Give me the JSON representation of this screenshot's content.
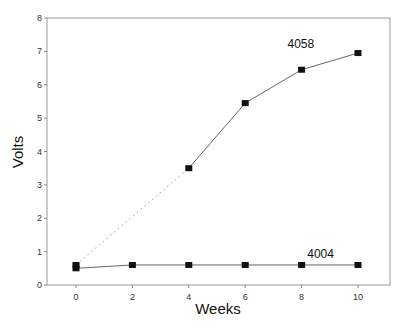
{
  "chart_data": {
    "type": "line",
    "title": "",
    "xlabel": "Weeks",
    "ylabel": "Volts",
    "xlim": [
      -1.05,
      11.1
    ],
    "ylim": [
      0,
      8
    ],
    "x_ticks": [
      0,
      2,
      4,
      6,
      8,
      10
    ],
    "y_ticks": [
      0,
      1,
      2,
      3,
      4,
      5,
      6,
      7,
      8
    ],
    "grid": false,
    "legend": "inline labels",
    "series": [
      {
        "name": "4058",
        "x": [
          0,
          4,
          6,
          8,
          10
        ],
        "values": [
          0.6,
          3.5,
          5.45,
          6.45,
          6.95
        ],
        "note": "segment from week 0 to week 4 drawn dotted",
        "label_pos": {
          "x": 7.5,
          "y": 7.1
        }
      },
      {
        "name": "4004",
        "x": [
          0,
          2,
          4,
          6,
          8,
          10
        ],
        "values": [
          0.5,
          0.6,
          0.6,
          0.6,
          0.6,
          0.6
        ],
        "label_pos": {
          "x": 8.2,
          "y": 0.8
        }
      }
    ]
  }
}
